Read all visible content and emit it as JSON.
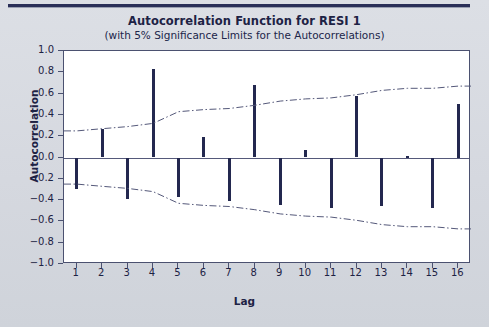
{
  "header": {
    "title": "Autocorrelation Function for RESI 1",
    "subtitle": "(with 5% Significance Limits for the Autocorrelations)"
  },
  "axes": {
    "ylabel": "Autocorrelation",
    "xlabel": "Lag"
  },
  "colors": {
    "bar": "#23284f",
    "frame": "#4b5170",
    "text": "#1d2244",
    "background": "#d7dae1",
    "plot_background": "#ffffff",
    "top_rule": "#2a2f58",
    "limit_line": "#55597a"
  },
  "chart_data": {
    "type": "bar",
    "title": "Autocorrelation Function for RESI 1",
    "subtitle": "(with 5% Significance Limits for the Autocorrelations)",
    "xlabel": "Lag",
    "ylabel": "Autocorrelation",
    "xlim": [
      0.5,
      16.5
    ],
    "ylim": [
      -1.0,
      1.0
    ],
    "grid": false,
    "legend": "none",
    "categories": [
      1,
      2,
      3,
      4,
      5,
      6,
      7,
      8,
      9,
      10,
      11,
      12,
      13,
      14,
      15,
      16
    ],
    "xticklabels": [
      "1",
      "2",
      "3",
      "4",
      "5",
      "6",
      "7",
      "8",
      "9",
      "10",
      "11",
      "12",
      "13",
      "14",
      "15",
      "16"
    ],
    "yticklabels": [
      "1.0",
      "0.8",
      "0.6",
      "0.4",
      "0.2",
      "0.0",
      "-0.2",
      "-0.4",
      "-0.6",
      "-0.8",
      "-1.0"
    ],
    "ytickvalues": [
      1.0,
      0.8,
      0.6,
      0.4,
      0.2,
      0.0,
      -0.2,
      -0.4,
      -0.6,
      -0.8,
      -1.0
    ],
    "values": [
      -0.3,
      0.27,
      -0.39,
      0.83,
      -0.37,
      0.19,
      -0.41,
      0.68,
      -0.45,
      0.07,
      -0.47,
      0.58,
      -0.46,
      0.01,
      -0.47,
      0.5
    ],
    "series": [
      {
        "name": "Autocorrelation",
        "values": [
          -0.3,
          0.27,
          -0.39,
          0.83,
          -0.37,
          0.19,
          -0.41,
          0.68,
          -0.45,
          0.07,
          -0.47,
          0.58,
          -0.46,
          0.01,
          -0.47,
          0.5
        ]
      },
      {
        "name": "Upper 5% Significance Limit",
        "type": "line",
        "style": "dash-dot",
        "values": [
          0.25,
          0.27,
          0.29,
          0.32,
          0.43,
          0.45,
          0.46,
          0.49,
          0.53,
          0.55,
          0.56,
          0.59,
          0.63,
          0.65,
          0.65,
          0.67
        ]
      },
      {
        "name": "Lower 5% Significance Limit",
        "type": "line",
        "style": "dash-dot",
        "values": [
          -0.25,
          -0.27,
          -0.29,
          -0.32,
          -0.43,
          -0.45,
          -0.46,
          -0.49,
          -0.53,
          -0.55,
          -0.56,
          -0.59,
          -0.63,
          -0.65,
          -0.65,
          -0.67
        ]
      }
    ]
  }
}
